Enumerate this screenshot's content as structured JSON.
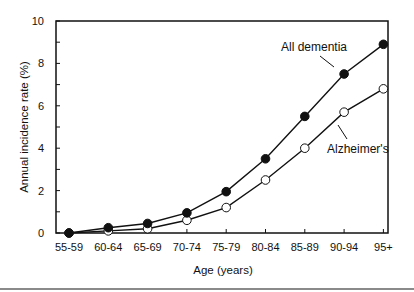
{
  "chart_data": {
    "type": "line",
    "title": "",
    "xlabel": "Age (years)",
    "ylabel": "Annual incidence rate (%)",
    "ylim": [
      0,
      10
    ],
    "yticks": [
      0,
      2,
      4,
      6,
      8,
      10
    ],
    "grid": false,
    "legend": "inline annotations",
    "categories": [
      "55-59",
      "60-64",
      "65-69",
      "70-74",
      "75-79",
      "80-84",
      "85-89",
      "90-94",
      "95+"
    ],
    "series": [
      {
        "name": "All dementia",
        "marker": "filled-circle",
        "values": [
          0.0,
          0.25,
          0.45,
          0.95,
          1.95,
          3.5,
          5.5,
          7.5,
          8.9
        ]
      },
      {
        "name": "Alzheimer's",
        "marker": "open-circle",
        "values": [
          0.0,
          0.1,
          0.2,
          0.6,
          1.2,
          2.5,
          4.0,
          5.7,
          6.8
        ]
      }
    ],
    "annotations": [
      {
        "text": "All dementia",
        "target_series": "All dementia"
      },
      {
        "text": "Alzheimer's",
        "target_series": "Alzheimer's"
      }
    ]
  },
  "colors": {
    "line": "#111111",
    "background": "#ffffff",
    "rule": "#8a8a8a"
  }
}
